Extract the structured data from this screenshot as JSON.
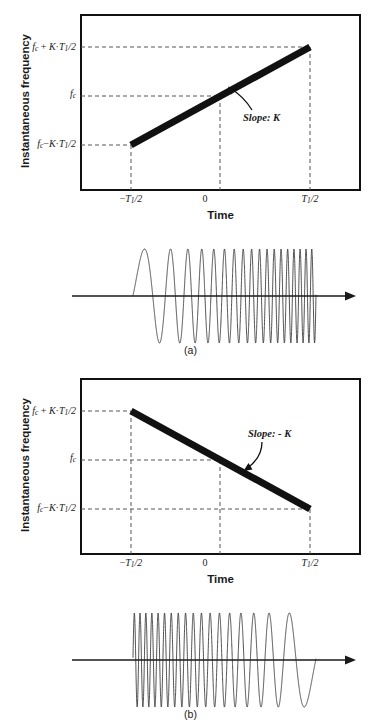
{
  "figure": {
    "panels": [
      {
        "id": "a",
        "caption": "(a)",
        "axis": {
          "ylabel": "Instantaneous frequency",
          "xlabel": "Time",
          "yticks": [
            {
              "label": "fc + K·T1/2",
              "base": "f",
              "sub1": "c",
              "op": " + ",
              "k": "K",
              "dot": "·",
              "t": "T",
              "sub2": "1",
              "tail": "/2"
            },
            {
              "label": "fc",
              "base": "f",
              "sub1": "c",
              "op": "",
              "k": "",
              "dot": "",
              "t": "",
              "sub2": "",
              "tail": ""
            },
            {
              "label": "fc − K·T1/2",
              "base": "f",
              "sub1": "c",
              "op": "−",
              "k": "K",
              "dot": "·",
              "t": "T",
              "sub2": "1",
              "tail": "/2"
            }
          ],
          "xticks": [
            {
              "label": "−T1/2",
              "pre": "−",
              "t": "T",
              "sub": "1",
              "tail": "/2"
            },
            {
              "label": "0",
              "pre": "",
              "t": "0",
              "sub": "",
              "tail": ""
            },
            {
              "label": "T1/2",
              "pre": "",
              "t": "T",
              "sub": "1",
              "tail": "/2"
            }
          ]
        },
        "annotation": "Slope: K",
        "waveform_type": "up-chirp"
      },
      {
        "id": "b",
        "caption": "(b)",
        "axis": {
          "ylabel": "Instantaneous frequency",
          "xlabel": "Time",
          "yticks": [
            {
              "label": "fc + K·T1/2",
              "base": "f",
              "sub1": "c",
              "op": " + ",
              "k": "K",
              "dot": "·",
              "t": "T",
              "sub2": "1",
              "tail": "/2"
            },
            {
              "label": "fc",
              "base": "f",
              "sub1": "c",
              "op": "",
              "k": "",
              "dot": "",
              "t": "",
              "sub2": "",
              "tail": ""
            },
            {
              "label": "fc − K·T1/2",
              "base": "f",
              "sub1": "c",
              "op": "−",
              "k": "K",
              "dot": "·",
              "t": "T",
              "sub2": "1",
              "tail": "/2"
            }
          ],
          "xticks": [
            {
              "label": "−T1/2",
              "pre": "−",
              "t": "T",
              "sub": "1",
              "tail": "/2"
            },
            {
              "label": "0",
              "pre": "",
              "t": "0",
              "sub": "",
              "tail": ""
            },
            {
              "label": "T1/2",
              "pre": "",
              "t": "T",
              "sub": "1",
              "tail": "/2"
            }
          ]
        },
        "annotation": "Slope: - K",
        "waveform_type": "down-chirp"
      }
    ]
  },
  "chart_data": [
    {
      "type": "line",
      "panel": "a",
      "title": "Instantaneous frequency of an up-chirp",
      "xlabel": "Time",
      "ylabel": "Instantaneous frequency",
      "x": [
        -0.5,
        0.5
      ],
      "y": [
        -1,
        1
      ],
      "xtick_labels": [
        "−T1/2",
        "0",
        "T1/2"
      ],
      "xtick_values": [
        -0.5,
        0,
        0.5
      ],
      "ytick_labels": [
        "fc − K·T1/2",
        "fc",
        "fc + K·T1/2"
      ],
      "ytick_values": [
        -1,
        0,
        1
      ],
      "xlim": [
        -0.85,
        0.85
      ],
      "ylim": [
        -1.45,
        1.35
      ],
      "grid": false,
      "legend": null,
      "annotations": [
        {
          "text": "Slope: K",
          "x": 0.33,
          "y": 0.12
        }
      ],
      "series": [
        {
          "name": "instantaneous frequency",
          "slope": "K",
          "values": [
            -1,
            1
          ]
        }
      ]
    },
    {
      "type": "line",
      "panel": "b",
      "title": "Instantaneous frequency of a down-chirp",
      "xlabel": "Time",
      "ylabel": "Instantaneous frequency",
      "x": [
        -0.5,
        0.5
      ],
      "y": [
        1,
        -1
      ],
      "xtick_labels": [
        "−T1/2",
        "0",
        "T1/2"
      ],
      "xtick_values": [
        -0.5,
        0,
        0.5
      ],
      "ytick_labels": [
        "fc − K·T1/2",
        "fc",
        "fc + K·T1/2"
      ],
      "ytick_values": [
        -1,
        0,
        1
      ],
      "xlim": [
        -0.85,
        0.85
      ],
      "ylim": [
        -1.45,
        1.35
      ],
      "grid": false,
      "legend": null,
      "annotations": [
        {
          "text": "Slope: - K",
          "x": 0.36,
          "y": 0.45
        }
      ],
      "series": [
        {
          "name": "instantaneous frequency",
          "slope": "-K",
          "values": [
            1,
            -1
          ]
        }
      ]
    }
  ],
  "colors": {
    "ink": "#1a1a1a",
    "line": "#111111",
    "dashed": "#555555",
    "background": "#ffffff"
  }
}
